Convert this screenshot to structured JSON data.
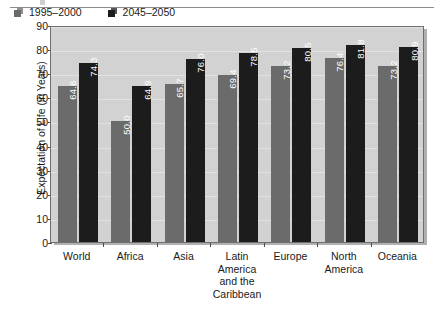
{
  "chart_data": {
    "type": "bar",
    "title": "",
    "xlabel": "",
    "ylabel": "Expectation of Life (in Years)",
    "ylim": [
      0,
      90
    ],
    "ytick_step": 10,
    "yticks": [
      90,
      80,
      70,
      60,
      50,
      40,
      30,
      20,
      10,
      0
    ],
    "grid": true,
    "legend_position": "top-left-inside",
    "categories": [
      "World",
      "Africa",
      "Asia",
      "Latin America and the Caribbean",
      "Europe",
      "North America",
      "Oceania"
    ],
    "category_lines": [
      [
        "World"
      ],
      [
        "Africa"
      ],
      [
        "Asia"
      ],
      [
        "Latin",
        "America",
        "and the",
        "Caribbean"
      ],
      [
        "Europe"
      ],
      [
        "North",
        "America"
      ],
      [
        "Oceania"
      ]
    ],
    "series": [
      {
        "name": "1995–2000",
        "color": "#6b6b6b",
        "values": [
          64.6,
          50.0,
          65.7,
          69.4,
          73.2,
          76.4,
          73.2
        ],
        "labels": [
          "64.6",
          "50.0",
          "65.7",
          "69.4",
          "73.2",
          "76.4",
          "73.2"
        ]
      },
      {
        "name": "2045–2050",
        "color": "#1c1c1c",
        "values": [
          74.3,
          64.9,
          76.0,
          78.5,
          80.5,
          81.8,
          80.9
        ],
        "labels": [
          "74.3",
          "64.9",
          "76.0",
          "78.5",
          "80.5",
          "81.8",
          "80.9"
        ]
      }
    ]
  },
  "colors": {
    "plot_background": "#d2d2d2",
    "plot_border": "#6f6f6f",
    "gridline": "#e2e2e2",
    "series_1": "#6b6b6b",
    "series_2": "#1c1c1c",
    "value_label": "#ffffff",
    "axis_text": "#1a1a1a",
    "page_rule": "#8c8c8c"
  }
}
